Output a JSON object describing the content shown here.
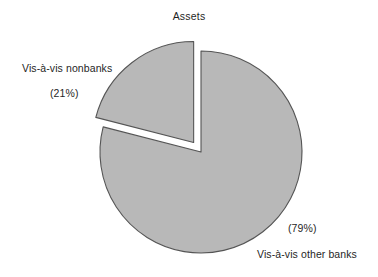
{
  "chart_data": {
    "type": "pie",
    "title": "Assets",
    "xlabel": "",
    "ylabel": "",
    "categories": [
      "Vis-à-vis nonbanks",
      "Vis-à-vis other banks"
    ],
    "values": [
      21,
      79
    ],
    "value_labels": [
      "(21%)",
      "(79%)"
    ],
    "units": "percent",
    "legend": "none",
    "grid": false,
    "exploded_slices": [
      "Vis-à-vis nonbanks"
    ],
    "start_angle_deg": 0,
    "direction": "counterclockwise",
    "slices": [
      {
        "label": "Vis-à-vis nonbanks",
        "value": 21,
        "value_label": "(21%)",
        "color": "#b8b8b8",
        "edge_color": "#555555",
        "exploded": true,
        "label_position": "left"
      },
      {
        "label": "Vis-à-vis other banks",
        "value": 79,
        "value_label": "(79%)",
        "color": "#b8b8b8",
        "edge_color": "#555555",
        "exploded": false,
        "label_position": "bottom-right"
      }
    ]
  },
  "figure": {
    "title": "Assets",
    "background": "#ffffff",
    "slice_fill": "#b8b8b8",
    "slice_stroke": "#555555"
  },
  "labels": {
    "nonbanks_name": "Vis-à-vis nonbanks",
    "nonbanks_pct": "(21%)",
    "otherbanks_name": "Vis-à-vis other banks",
    "otherbanks_pct": "(79%)"
  }
}
